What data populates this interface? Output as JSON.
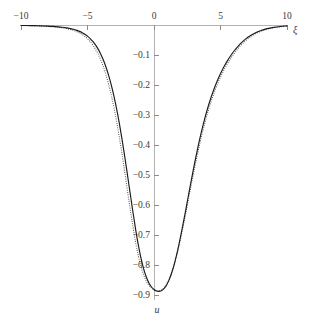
{
  "chart_data": {
    "type": "line",
    "title": "",
    "xlabel": "ξ",
    "ylabel": "u",
    "xlim": [
      -10,
      10
    ],
    "ylim": [
      -0.9,
      0
    ],
    "grid": false,
    "legend": null,
    "x_ticks": [
      -10,
      -5,
      0,
      5,
      10
    ],
    "x_tick_labels": [
      "-10",
      "-5",
      "0",
      "5",
      "10"
    ],
    "y_ticks": [
      -0.1,
      -0.2,
      -0.3,
      -0.4,
      -0.5,
      -0.6,
      -0.7,
      -0.8,
      -0.9
    ],
    "y_tick_labels": [
      "-0.1",
      "-0.2",
      "-0.3",
      "-0.4",
      "-0.5",
      "-0.6",
      "-0.7",
      "-0.8",
      "-0.9"
    ],
    "minimum": {
      "x": 0.35,
      "y": -0.89
    },
    "series": [
      {
        "name": "solid-curve",
        "style": "solid",
        "color": "#1a1a1a",
        "x": [
          -10.0,
          -9.5,
          -9.0,
          -8.5,
          -8.0,
          -7.6,
          -7.2,
          -6.9,
          -6.6,
          -6.3,
          -6.05,
          -5.8,
          -5.6,
          -5.4,
          -5.2,
          -5.0,
          -4.8,
          -4.6,
          -4.4,
          -4.2,
          -4.0,
          -3.8,
          -3.6,
          -3.4,
          -3.2,
          -3.0,
          -2.8,
          -2.6,
          -2.4,
          -2.2,
          -2.0,
          -1.8,
          -1.6,
          -1.4,
          -1.2,
          -1.0,
          -0.8,
          -0.6,
          -0.4,
          -0.2,
          0.0,
          0.15,
          0.35,
          0.55,
          0.75,
          0.95,
          1.15,
          1.35,
          1.55,
          1.8,
          2.05,
          2.3,
          2.55,
          2.8,
          3.05,
          3.3,
          3.55,
          3.8,
          4.05,
          4.3,
          4.55,
          4.8,
          5.05,
          5.3,
          5.55,
          5.8,
          6.05,
          6.3,
          6.6,
          6.9,
          7.2,
          7.6,
          8.0,
          8.5,
          9.0,
          9.5,
          10.0
        ],
        "y": [
          -0.0015,
          -0.0018,
          -0.0023,
          -0.0029,
          -0.0038,
          -0.0048,
          -0.0062,
          -0.0076,
          -0.0094,
          -0.0118,
          -0.0143,
          -0.0178,
          -0.0212,
          -0.0255,
          -0.0308,
          -0.0372,
          -0.0452,
          -0.0548,
          -0.0665,
          -0.0805,
          -0.0975,
          -0.1175,
          -0.1415,
          -0.1695,
          -0.202,
          -0.2395,
          -0.282,
          -0.3295,
          -0.382,
          -0.4385,
          -0.498,
          -0.5585,
          -0.6185,
          -0.676,
          -0.728,
          -0.773,
          -0.8095,
          -0.8375,
          -0.858,
          -0.8725,
          -0.8815,
          -0.886,
          -0.888,
          -0.886,
          -0.879,
          -0.8665,
          -0.848,
          -0.8235,
          -0.793,
          -0.747,
          -0.694,
          -0.637,
          -0.5775,
          -0.5185,
          -0.4615,
          -0.408,
          -0.359,
          -0.3145,
          -0.275,
          -0.24,
          -0.209,
          -0.1815,
          -0.1575,
          -0.136,
          -0.117,
          -0.1,
          -0.085,
          -0.0718,
          -0.0578,
          -0.0462,
          -0.0366,
          -0.0266,
          -0.019,
          -0.0122,
          -0.0078,
          -0.0049,
          -0.0031
        ]
      },
      {
        "name": "dotted-curve",
        "style": "dotted",
        "color": "#4d4d4d",
        "x": [
          -10.0,
          -9.5,
          -9.0,
          -8.5,
          -8.0,
          -7.6,
          -7.2,
          -6.9,
          -6.6,
          -6.3,
          -6.05,
          -5.8,
          -5.6,
          -5.4,
          -5.2,
          -5.0,
          -4.8,
          -4.6,
          -4.4,
          -4.2,
          -4.0,
          -3.8,
          -3.6,
          -3.4,
          -3.2,
          -3.0,
          -2.8,
          -2.6,
          -2.4,
          -2.2,
          -2.0,
          -1.8,
          -1.6,
          -1.4,
          -1.2,
          -1.0,
          -0.8,
          -0.6,
          -0.4,
          -0.2,
          0.0,
          0.15,
          0.35,
          0.55,
          0.75,
          0.95,
          1.15,
          1.35,
          1.55,
          1.8,
          2.05,
          2.3,
          2.55,
          2.8,
          3.05,
          3.3,
          3.55,
          3.8,
          4.05,
          4.3,
          4.55,
          4.8,
          5.05,
          5.3,
          5.55,
          5.8,
          6.05,
          6.3,
          6.6,
          6.9,
          7.2,
          7.6,
          8.0,
          8.5,
          9.0,
          9.5,
          10.0
        ],
        "y": [
          -0.0018,
          -0.0023,
          -0.0029,
          -0.0037,
          -0.0048,
          -0.0061,
          -0.0078,
          -0.0096,
          -0.0119,
          -0.0148,
          -0.018,
          -0.0222,
          -0.0264,
          -0.0317,
          -0.038,
          -0.0458,
          -0.0553,
          -0.0668,
          -0.0806,
          -0.0971,
          -0.117,
          -0.1402,
          -0.1678,
          -0.1996,
          -0.2362,
          -0.2778,
          -0.3244,
          -0.3758,
          -0.4316,
          -0.4906,
          -0.551,
          -0.611,
          -0.6682,
          -0.7202,
          -0.765,
          -0.8018,
          -0.8305,
          -0.8518,
          -0.8668,
          -0.8766,
          -0.8824,
          -0.8848,
          -0.8856,
          -0.883,
          -0.876,
          -0.8638,
          -0.8462,
          -0.823,
          -0.7944,
          -0.7512,
          -0.7014,
          -0.6472,
          -0.5902,
          -0.533,
          -0.4772,
          -0.4244,
          -0.3754,
          -0.3306,
          -0.2904,
          -0.2546,
          -0.2228,
          -0.1944,
          -0.1694,
          -0.147,
          -0.1272,
          -0.1094,
          -0.0936,
          -0.0796,
          -0.0646,
          -0.052,
          -0.0414,
          -0.0304,
          -0.0218,
          -0.0141,
          -0.0091,
          -0.0058,
          -0.0037
        ]
      }
    ]
  },
  "geometry": {
    "x_axis_px": {
      "left": 21,
      "right": 287,
      "y": 25
    },
    "y_axis_px": {
      "x": 154,
      "top": 25,
      "bottom": 300
    },
    "px_per_x_unit": 13.3,
    "px_per_01_u": 30
  }
}
